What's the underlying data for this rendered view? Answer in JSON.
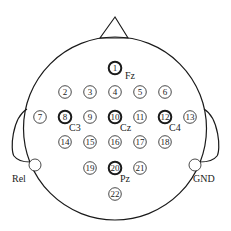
{
  "diagram": {
    "colors": {
      "stroke": "#1a1a1a",
      "fill": "#ffffff",
      "text": "#222222"
    },
    "head": {
      "cx": 115,
      "cy": 128.5,
      "r": 91.5
    },
    "nose": {
      "apex": [
        115,
        17
      ],
      "left": [
        100,
        38
      ],
      "right": [
        128,
        38
      ]
    },
    "electrodes": [
      {
        "id": "1",
        "label": "1",
        "x": 115,
        "y": 68,
        "bold": true,
        "site": "Fz",
        "sx": 125,
        "sy": 79
      },
      {
        "id": "2",
        "label": "2",
        "x": 65,
        "y": 92,
        "bold": false
      },
      {
        "id": "3",
        "label": "3",
        "x": 90,
        "y": 92,
        "bold": false
      },
      {
        "id": "4",
        "label": "4",
        "x": 115,
        "y": 92,
        "bold": false
      },
      {
        "id": "5",
        "label": "5",
        "x": 140,
        "y": 92,
        "bold": false
      },
      {
        "id": "6",
        "label": "6",
        "x": 165,
        "y": 92,
        "bold": false
      },
      {
        "id": "7",
        "label": "7",
        "x": 40,
        "y": 117,
        "bold": false
      },
      {
        "id": "8",
        "label": "8",
        "x": 65,
        "y": 117,
        "bold": true,
        "site": "C3",
        "sx": 69,
        "sy": 131
      },
      {
        "id": "9",
        "label": "9",
        "x": 90,
        "y": 117,
        "bold": false
      },
      {
        "id": "10",
        "label": "10",
        "x": 115,
        "y": 117,
        "bold": true,
        "site": "Cz",
        "sx": 120,
        "sy": 131
      },
      {
        "id": "11",
        "label": "11",
        "x": 140,
        "y": 117,
        "bold": false
      },
      {
        "id": "12",
        "label": "12",
        "x": 165,
        "y": 117,
        "bold": true,
        "site": "C4",
        "sx": 169,
        "sy": 131
      },
      {
        "id": "13",
        "label": "13",
        "x": 190,
        "y": 117,
        "bold": false
      },
      {
        "id": "14",
        "label": "14",
        "x": 65,
        "y": 142,
        "bold": false
      },
      {
        "id": "15",
        "label": "15",
        "x": 90,
        "y": 142,
        "bold": false
      },
      {
        "id": "16",
        "label": "16",
        "x": 115,
        "y": 142,
        "bold": false
      },
      {
        "id": "17",
        "label": "17",
        "x": 140,
        "y": 142,
        "bold": false
      },
      {
        "id": "18",
        "label": "18",
        "x": 165,
        "y": 142,
        "bold": false
      },
      {
        "id": "19",
        "label": "19",
        "x": 90,
        "y": 168,
        "bold": false
      },
      {
        "id": "20",
        "label": "20",
        "x": 115,
        "y": 168,
        "bold": true,
        "site": "Pz",
        "sx": 120,
        "sy": 182
      },
      {
        "id": "21",
        "label": "21",
        "x": 140,
        "y": 168,
        "bold": false
      },
      {
        "id": "22",
        "label": "22",
        "x": 115,
        "y": 194,
        "bold": false
      }
    ],
    "references": [
      {
        "id": "rel",
        "label": "Rel",
        "x": 35,
        "y": 165,
        "lx": 12,
        "ly": 182
      },
      {
        "id": "gnd",
        "label": "GND",
        "x": 195,
        "y": 165,
        "lx": 193,
        "ly": 182
      }
    ]
  }
}
